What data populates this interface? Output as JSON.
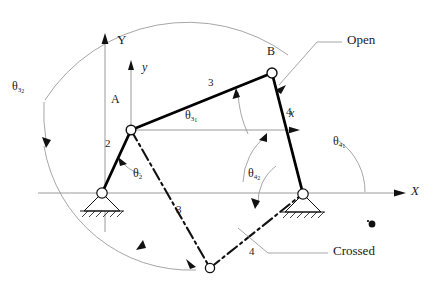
{
  "figure": {
    "type": "kinematic-diagram"
  },
  "axes": {
    "global": {
      "x_label": "X",
      "y_label": "Y",
      "origin_name": "O2"
    },
    "local": {
      "x_label": "x",
      "y_label": "y",
      "origin_name": "A"
    }
  },
  "joints": [
    {
      "name": "A",
      "label": "A",
      "x": 131,
      "y": 130
    },
    {
      "name": "B",
      "label": "B",
      "x": 272,
      "y": 73
    },
    {
      "name": "O2",
      "label": "",
      "x": 102,
      "y": 193
    },
    {
      "name": "O4",
      "label": "",
      "x": 303,
      "y": 194
    },
    {
      "name": "B-crossed",
      "label": "",
      "x": 210,
      "y": 268
    }
  ],
  "links": [
    {
      "name": "link-2",
      "label": "2",
      "from": "O2",
      "to": "A",
      "style": "solid"
    },
    {
      "name": "link-3-open",
      "label": "3",
      "from": "A",
      "to": "B",
      "style": "solid"
    },
    {
      "name": "link-4-open",
      "label": "4",
      "from": "B",
      "to": "O4",
      "style": "solid"
    },
    {
      "name": "link-3-crossed",
      "label": "3",
      "from": "A",
      "to": "B-crossed",
      "style": "dash-dot"
    },
    {
      "name": "link-4-crossed",
      "label": "4",
      "from": "B-crossed",
      "to": "O4",
      "style": "dash-dot"
    }
  ],
  "angles": [
    {
      "name": "theta-2",
      "symbol": "θ",
      "sub": "2",
      "subsub": ""
    },
    {
      "name": "theta-3-1",
      "symbol": "θ",
      "sub": "3",
      "subsub": "1"
    },
    {
      "name": "theta-3-2",
      "symbol": "θ",
      "sub": "3",
      "subsub": "2"
    },
    {
      "name": "theta-4-1",
      "symbol": "θ",
      "sub": "4",
      "subsub": "1"
    },
    {
      "name": "theta-4-2",
      "symbol": "θ",
      "sub": "4",
      "subsub": "2"
    }
  ],
  "callouts": [
    {
      "name": "open-callout",
      "label": "Open"
    },
    {
      "name": "crossed-callout",
      "label": "Crossed"
    }
  ],
  "colors": {
    "link_solid": "#000000",
    "axis_line": "#8a8a8a",
    "arc": "#8a8a8a",
    "leader": "#8a8a8a",
    "text": "#1a1a1a",
    "background": "#ffffff"
  }
}
